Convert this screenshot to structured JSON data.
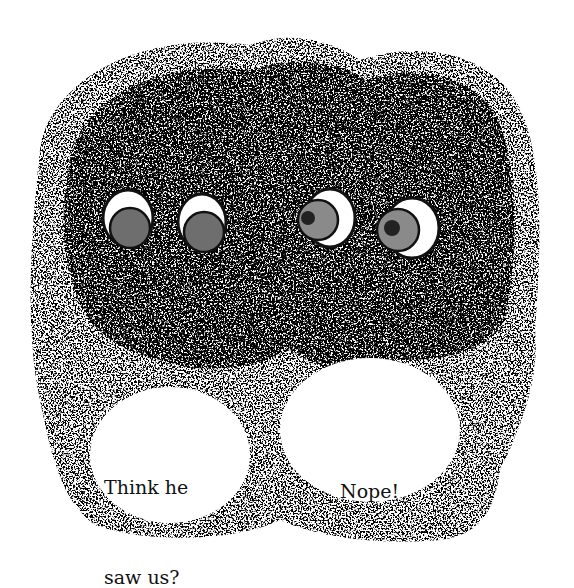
{
  "illustration": {
    "style": "stippled ink drawing",
    "colors": {
      "ink": "#1a1a1a",
      "background": "#ffffff",
      "iris": "#6e6e6e"
    },
    "eyes": [
      {
        "pair": "left",
        "cx": 128,
        "cy": 218,
        "look": "down"
      },
      {
        "pair": "left",
        "cx": 202,
        "cy": 222,
        "look": "down"
      },
      {
        "pair": "right",
        "cx": 327,
        "cy": 220,
        "look": "left"
      },
      {
        "pair": "right",
        "cx": 408,
        "cy": 228,
        "look": "left"
      }
    ]
  },
  "bubbles": {
    "left": {
      "line1": "Think he",
      "line2": "saw us?"
    },
    "right": {
      "text": "Nope!"
    }
  }
}
